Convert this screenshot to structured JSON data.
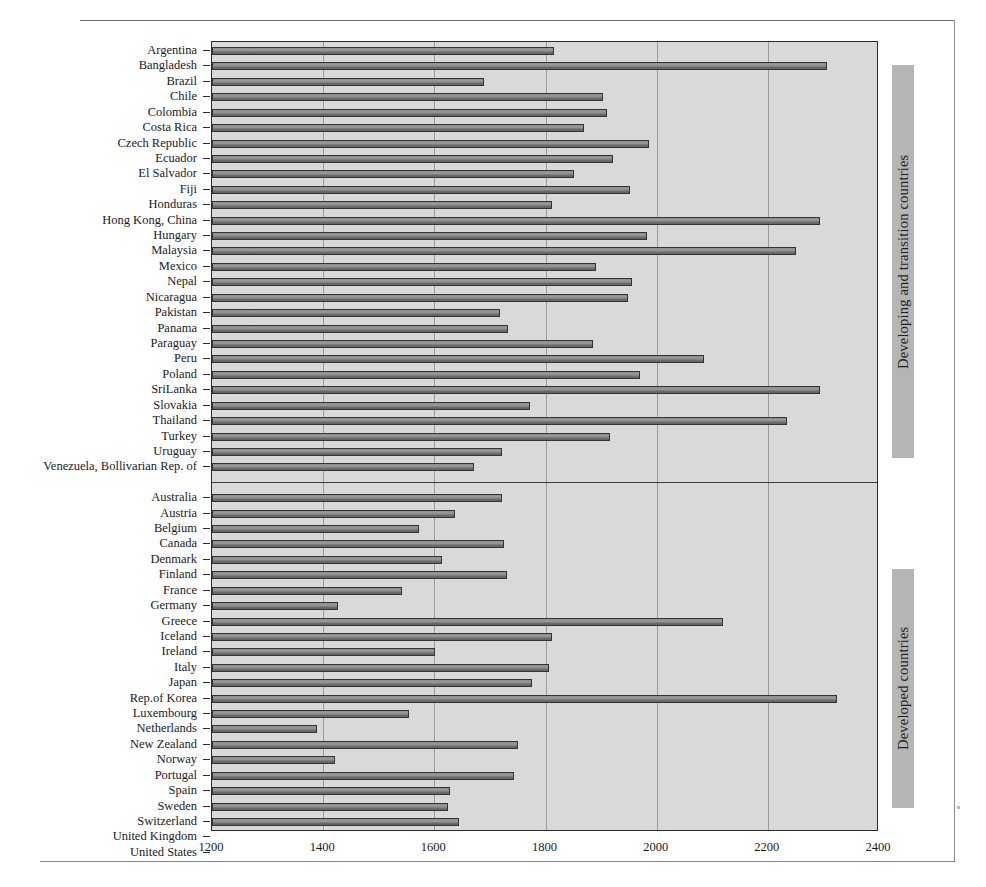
{
  "chart_data": {
    "type": "bar",
    "orientation": "horizontal",
    "title": "",
    "xlabel": "",
    "ylabel": "",
    "xlim": [
      1200,
      2400
    ],
    "xticks": [
      1200,
      1400,
      1600,
      1800,
      2000,
      2200,
      2400
    ],
    "grid": true,
    "legend_position": "right-outside",
    "groups": [
      {
        "name": "Developing and transition countries",
        "categories": [
          "Argentina",
          "Bangladesh",
          "Brazil",
          "Chile",
          "Colombia",
          "Costa Rica",
          "Czech Republic",
          "Ecuador",
          "El Salvador",
          "Fiji",
          "Honduras",
          "Hong Kong, China",
          "Hungary",
          "Malaysia",
          "Mexico",
          "Nepal",
          "Nicaragua",
          "Pakistan",
          "Panama",
          "Paraguay",
          "Peru",
          "Poland",
          "SriLanka",
          "Slovakia",
          "Thailand",
          "Turkey",
          "Uruguay",
          "Venezuela, Bollivarian Rep. of"
        ],
        "values": [
          1815,
          2306,
          1690,
          1903,
          1910,
          1869,
          1986,
          1922,
          1852,
          1952,
          1812,
          2293,
          1983,
          2250,
          1890,
          1956,
          1948,
          1719,
          1733,
          1886,
          2086,
          1970,
          2293,
          1772,
          2235,
          1916,
          1722,
          1672
        ]
      },
      {
        "name": "Developed countries",
        "categories": [
          "Australia",
          "Austria",
          "Belgium",
          "Canada",
          "Denmark",
          "Finland",
          "France",
          "Germany",
          "Greece",
          "Iceland",
          "Ireland",
          "Italy",
          "Japan",
          "Rep.of Korea",
          "Luxembourg",
          "Netherlands",
          "New Zealand",
          "Norway",
          "Portugal",
          "Spain",
          "Sweden",
          "Switzerland",
          "United Kingdom",
          "United States"
        ],
        "values": [
          1722,
          1637,
          1572,
          1726,
          1613,
          1730,
          1542,
          1427,
          2120,
          1812,
          1601,
          1807,
          1775,
          2324,
          1555,
          1389,
          1750,
          1422,
          1744,
          1629,
          1625,
          1645,
          1657,
          1800
        ]
      }
    ]
  },
  "colors": {
    "plot_background": "#d9d9d9",
    "bar_fill": "#8d8d8d",
    "bar_stroke": "#343434",
    "gridline": "#9b9b9b",
    "legend_background": "#b5b5b5",
    "axis": "#2b2b2b",
    "text": "#1a1a1a"
  }
}
